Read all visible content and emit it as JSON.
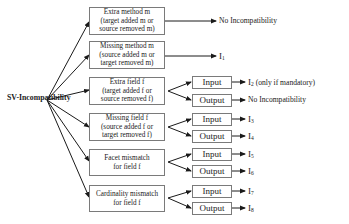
{
  "diagram": {
    "root": "SV-Incompatibility",
    "categories": [
      {
        "lines": [
          "Extra method m",
          "(target added m or",
          "source removed m)"
        ],
        "result": "No Incompatibility"
      },
      {
        "lines": [
          "Missing method m",
          "(source added m or",
          "target removed m)"
        ],
        "result": "I1"
      },
      {
        "lines": [
          "Extra field f",
          "(target added f or",
          "source removed f)"
        ],
        "branches": [
          {
            "label": "Input",
            "result": "I2 (only if mandatory)"
          },
          {
            "label": "Output",
            "result": "No Incompatibility"
          }
        ]
      },
      {
        "lines": [
          "Missing field f",
          "(source added f or",
          "target removed f)"
        ],
        "branches": [
          {
            "label": "Input",
            "result": "I3"
          },
          {
            "label": "Output",
            "result": "I4"
          }
        ]
      },
      {
        "lines": [
          "Facet mismatch",
          "for field f"
        ],
        "branches": [
          {
            "label": "Input",
            "result": "I5"
          },
          {
            "label": "Output",
            "result": "I6"
          }
        ]
      },
      {
        "lines": [
          "Cardinality mismatch",
          "for field f"
        ],
        "branches": [
          {
            "label": "Input",
            "result": "I7"
          },
          {
            "label": "Output",
            "result": "I8"
          }
        ]
      }
    ],
    "colors": {
      "line": "#1a1a1a",
      "box_border": "#7a7a7a",
      "background": "#ffffff"
    }
  }
}
